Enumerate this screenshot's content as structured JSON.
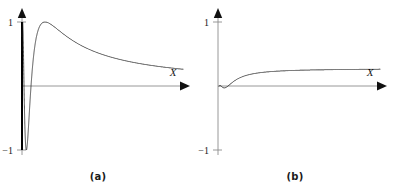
{
  "figure": {
    "background_color": "#ffffff",
    "curve_color": "#111111",
    "axis_color": "#8c8c8c",
    "text_color": "#1a1a1a"
  },
  "panels": [
    {
      "id": "a",
      "caption": "(a)",
      "x_axis_label": "X",
      "y_tick_top": "1",
      "y_tick_bottom": "−1"
    },
    {
      "id": "b",
      "caption": "(b)",
      "x_axis_label": "X",
      "y_tick_top": "1",
      "y_tick_bottom": "−1"
    }
  ],
  "chart_data": [
    {
      "type": "line",
      "title": "(a)",
      "xlabel": "X",
      "ylabel": "",
      "ylim": [
        -1,
        1
      ],
      "xlim": [
        0,
        1
      ],
      "grid": false,
      "legend": "none",
      "description": "Constant-amplitude chirp: oscillation of unit amplitude whose frequency is very high near the left edge (x near 0) and decreases steadily toward the right; resembles sin(1/x).",
      "yticks": [
        -1,
        1
      ],
      "ytick_labels": [
        "−1",
        "1"
      ],
      "amplitude_envelope": "constant at 1",
      "series": [
        {
          "name": "sin(1/x)",
          "formula": "y = sin(c / x)",
          "x": [
            0.0,
            0.02,
            0.04,
            0.06,
            0.08,
            0.1,
            0.12,
            0.14,
            0.16,
            0.18,
            0.2,
            0.24,
            0.28,
            0.32,
            0.36,
            0.4,
            0.44,
            0.48,
            0.52,
            0.56,
            0.6,
            0.64,
            0.68,
            0.72,
            0.76,
            0.8,
            0.84,
            0.88,
            0.92,
            0.96,
            1.0
          ],
          "values": [
            0.0,
            -0.6,
            0.9,
            -0.3,
            -0.8,
            1.0,
            -0.2,
            -1.0,
            0.7,
            0.6,
            -1.0,
            0.95,
            -0.9,
            0.1,
            0.98,
            -0.55,
            -0.85,
            0.99,
            0.05,
            -1.0,
            0.45,
            0.9,
            -0.6,
            -0.95,
            0.3,
            1.0,
            0.1,
            -0.95,
            -0.7,
            0.2,
            0.85
          ]
        }
      ]
    },
    {
      "type": "line",
      "title": "(b)",
      "xlabel": "X",
      "ylabel": "",
      "ylim": [
        -1,
        1
      ],
      "xlim": [
        0,
        1
      ],
      "grid": false,
      "legend": "none",
      "description": "Amplitude-modulated chirp: same decreasing-frequency oscillation as (a) but the envelope grows linearly from zero at the left edge, so early wiggles are tiny and later swings approach ±1; resembles x·sin(1/x).",
      "yticks": [
        -1,
        1
      ],
      "ytick_labels": [
        "−1",
        "1"
      ],
      "amplitude_envelope": "grows linearly from 0 to about 1",
      "series": [
        {
          "name": "x·sin(1/x)",
          "formula": "y = x · sin(c / x)",
          "x": [
            0.0,
            0.02,
            0.04,
            0.06,
            0.08,
            0.1,
            0.12,
            0.14,
            0.16,
            0.18,
            0.2,
            0.24,
            0.28,
            0.32,
            0.36,
            0.4,
            0.44,
            0.48,
            0.52,
            0.56,
            0.6,
            0.64,
            0.68,
            0.72,
            0.76,
            0.8,
            0.84,
            0.88,
            0.92,
            0.96,
            1.0
          ],
          "values": [
            0.0,
            -0.012,
            0.036,
            -0.018,
            -0.064,
            0.1,
            -0.024,
            -0.14,
            0.112,
            0.108,
            -0.2,
            0.228,
            -0.252,
            0.032,
            0.353,
            -0.22,
            -0.374,
            0.475,
            0.026,
            -0.56,
            0.27,
            0.576,
            -0.408,
            -0.684,
            0.228,
            0.8,
            0.084,
            -0.836,
            -0.644,
            0.192,
            0.85
          ]
        }
      ]
    }
  ]
}
